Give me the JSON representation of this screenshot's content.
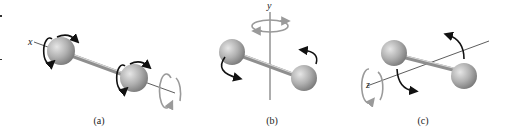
{
  "figure": {
    "panels": [
      {
        "id": "a",
        "caption": "(a)",
        "axis_label": "x",
        "description": "Rotation of diatomic molecule about the x-axis (molecular axis)"
      },
      {
        "id": "b",
        "caption": "(b)",
        "axis_label": "y",
        "description": "Rotation about the y-axis (perpendicular)"
      },
      {
        "id": "c",
        "caption": "(c)",
        "axis_label": "z",
        "description": "Rotation about the z-axis (perpendicular)"
      }
    ],
    "colors": {
      "atom": "#a8a8a8",
      "atom_highlight": "#e6e6e6",
      "rod": "#8f8f8f",
      "arrow": "#111111",
      "axis": "#333333"
    }
  }
}
